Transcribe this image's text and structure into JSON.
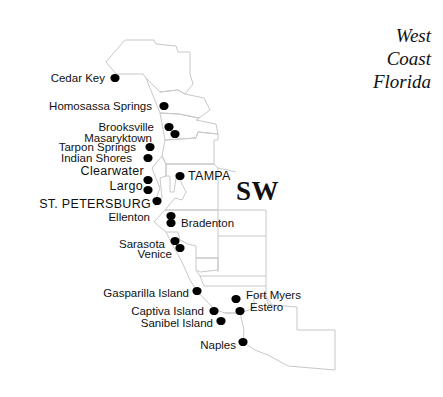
{
  "title": {
    "lines": [
      "West",
      "Coast",
      "Florida"
    ]
  },
  "region_label": "SW",
  "colors": {
    "boundary": "#c8c8c8",
    "dot": "#000000",
    "text": "#111111",
    "background": "#ffffff"
  },
  "cities": [
    {
      "name": "Cedar Key",
      "x": 115,
      "y": 78,
      "lx": 105,
      "ly": 82,
      "anchor": "end",
      "major": false
    },
    {
      "name": "Homosassa Springs",
      "x": 164,
      "y": 106,
      "lx": 152,
      "ly": 110,
      "anchor": "end",
      "major": false
    },
    {
      "name": "Brooksville",
      "x": 169,
      "y": 127,
      "lx": 154,
      "ly": 131,
      "anchor": "end",
      "major": false
    },
    {
      "name": "Masaryktown",
      "x": 175,
      "y": 134,
      "lx": 152,
      "ly": 142,
      "anchor": "end",
      "major": false
    },
    {
      "name": "Tarpon Springs",
      "x": 150,
      "y": 147,
      "lx": 136,
      "ly": 151,
      "anchor": "end",
      "major": false
    },
    {
      "name": "Indian Shores",
      "x": 148,
      "y": 158,
      "lx": 132,
      "ly": 162,
      "anchor": "end",
      "major": false
    },
    {
      "name": "Clearwater",
      "x": 148,
      "y": 180,
      "lx": 144,
      "ly": 175,
      "anchor": "end",
      "major": true
    },
    {
      "name": "Largo",
      "x": 148,
      "y": 190,
      "lx": 143,
      "ly": 190,
      "anchor": "end",
      "major": true
    },
    {
      "name": "ST. PETERSBURG",
      "x": 157,
      "y": 201,
      "lx": 151,
      "ly": 208,
      "anchor": "end",
      "major": true
    },
    {
      "name": "TAMPA",
      "x": 180,
      "y": 176,
      "lx": 188,
      "ly": 180,
      "anchor": "start",
      "major": true
    },
    {
      "name": "Ellenton",
      "x": 171,
      "y": 216,
      "lx": 150,
      "ly": 221,
      "anchor": "end",
      "major": false
    },
    {
      "name": "Bradenton",
      "x": 171,
      "y": 223,
      "lx": 181,
      "ly": 227,
      "anchor": "start",
      "major": false
    },
    {
      "name": "Sarasota",
      "x": 175,
      "y": 241,
      "lx": 165,
      "ly": 248,
      "anchor": "end",
      "major": false
    },
    {
      "name": "Venice",
      "x": 180,
      "y": 248,
      "lx": 172,
      "ly": 258,
      "anchor": "end",
      "major": false
    },
    {
      "name": "Gasparilla Island",
      "x": 197,
      "y": 291,
      "lx": 189,
      "ly": 297,
      "anchor": "end",
      "major": false
    },
    {
      "name": "Fort Myers",
      "x": 236,
      "y": 299,
      "lx": 246,
      "ly": 299,
      "anchor": "start",
      "major": false
    },
    {
      "name": "Estero",
      "x": 240,
      "y": 311,
      "lx": 250,
      "ly": 311,
      "anchor": "start",
      "major": false
    },
    {
      "name": "Captiva Island",
      "x": 214,
      "y": 311,
      "lx": 204,
      "ly": 315,
      "anchor": "end",
      "major": false
    },
    {
      "name": "Sanibel Island",
      "x": 221,
      "y": 321,
      "lx": 213,
      "ly": 327,
      "anchor": "end",
      "major": false
    },
    {
      "name": "Naples",
      "x": 243,
      "y": 342,
      "lx": 236,
      "ly": 349,
      "anchor": "end",
      "major": false
    }
  ],
  "boundaries": [
    "M106,62 L125,40 L154,40 L156,44 L176,46 L178,52 L190,52 L190,74 L193,84 L185,94 L178,90 L160,92 L146,78 L143,74 L116,74 L106,62 Z",
    "M146,78 L160,92 L178,90 L185,94 L204,98 L210,110 L199,118 L179,114 L160,113 Z",
    "M160,113 L179,114 L199,118 L196,120 L216,124 L218,134 L198,132 L196,138 L165,140 Z",
    "M165,140 L196,138 L198,132 L218,134 L218,140 L214,140 L214,164 L166,164 L162,156 Z",
    "M162,156 L166,164 L166,176 L160,178 L162,198 L155,206 L157,196 L160,188 L155,176 L152,168 Z",
    "M166,164 L214,164 L218,168 L218,210 L165,210 L175,198 L182,200 L186,192 L180,180 L176,178 L174,192 L170,192 L170,176 L166,176 Z",
    "M218,168 L236,172",
    "M165,210 L266,210 L266,236 L218,236",
    "M218,210 L218,272",
    "M165,210 L154,222 L166,232 L178,232 L180,240 L188,244 L196,246 L196,258 L218,258",
    "M166,232 L172,244 L182,262 L190,280 L197,291",
    "M196,258 L218,258 L218,270 L200,272 L196,270 Z",
    "M196,270 L200,276 L266,276 L266,236",
    "M266,276 L266,296 L260,296",
    "M197,291 L214,309 L225,313 L240,313",
    "M200,276 L204,286 L266,286",
    "M225,313 L240,313 L254,308 L254,298 L258,296 L266,296",
    "M240,313 L244,330 L243,342 L255,350 L268,355 L288,366 L335,370 L335,330 L297,330 L297,307 L272,305 L266,296",
    "M266,296 L268,304 L272,305"
  ]
}
